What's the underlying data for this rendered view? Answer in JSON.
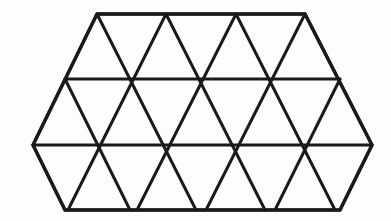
{
  "figure": {
    "name": "triangular-grid-hexagon",
    "background_color": "#ffffff",
    "stroke_color": "#1a1a1a",
    "stroke_width": 3,
    "canvas": {
      "width": 391,
      "height": 221
    },
    "geometry": {
      "triangle_side": 69,
      "triangle_height": 65.5,
      "rows": 3,
      "row_y": [
        14,
        79,
        145,
        210
      ],
      "upward_triangles_per_row": [
        4,
        5,
        4
      ],
      "downward_triangles_per_row": [
        3,
        4,
        4
      ],
      "total_triangles": 24
    },
    "hexagon_vertices": [
      {
        "label": "top-left",
        "x": 97,
        "y": 14
      },
      {
        "label": "top-right",
        "x": 305,
        "y": 14
      },
      {
        "label": "right-upper",
        "x": 372,
        "y": 145
      },
      {
        "label": "bottom-right",
        "x": 340,
        "y": 210
      },
      {
        "label": "bottom-left",
        "x": 65,
        "y": 210
      },
      {
        "label": "left-lower",
        "x": 33,
        "y": 145
      }
    ],
    "horizontal_lines": [
      {
        "name": "row-line-top",
        "y": 14,
        "x1": 97,
        "x2": 305
      },
      {
        "name": "row-line-second",
        "y": 79,
        "x1": 65,
        "x2": 340
      },
      {
        "name": "row-line-third",
        "y": 145,
        "x1": 33,
        "x2": 372
      },
      {
        "name": "row-line-bottom",
        "y": 210,
        "x1": 65,
        "x2": 340
      }
    ],
    "left_leaning_lines": [
      {
        "x1": 97,
        "y1": 14,
        "x2": 33,
        "y2": 145
      },
      {
        "x1": 166,
        "y1": 14,
        "x2": 68,
        "y2": 210
      },
      {
        "x1": 236,
        "y1": 14,
        "x2": 137,
        "y2": 210
      },
      {
        "x1": 305,
        "y1": 14,
        "x2": 206,
        "y2": 210
      },
      {
        "x1": 340,
        "y1": 79,
        "x2": 275,
        "y2": 210
      },
      {
        "x1": 372,
        "y1": 145,
        "x2": 340,
        "y2": 210
      }
    ],
    "right_leaning_lines": [
      {
        "x1": 97,
        "y1": 14,
        "x2": 196,
        "y2": 210
      },
      {
        "x1": 166,
        "y1": 14,
        "x2": 265,
        "y2": 210
      },
      {
        "x1": 236,
        "y1": 14,
        "x2": 335,
        "y2": 210
      },
      {
        "x1": 305,
        "y1": 14,
        "x2": 372,
        "y2": 145
      },
      {
        "x1": 65,
        "y1": 79,
        "x2": 130,
        "y2": 210
      },
      {
        "x1": 33,
        "y1": 145,
        "x2": 65,
        "y2": 210
      }
    ]
  }
}
